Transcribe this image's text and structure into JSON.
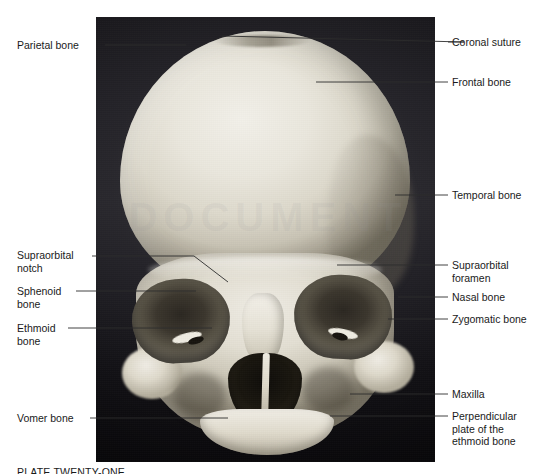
{
  "figure": {
    "watermark_text": "DOCUMENT",
    "caption": "PLATE TWENTY-ONE"
  },
  "photo": {
    "subject": "anterior view of human skull",
    "backdrop_color": "#1d1c21",
    "bone_color": "#eae7dd",
    "leader_line_color": "#2c2c2c"
  },
  "labels_left": [
    {
      "id": "parietal-bone",
      "text": "Parietal bone",
      "text_x": 17,
      "text_y": 39,
      "line_y": 45,
      "line_from_x": 105,
      "line_to_x": 186,
      "target_x": 186,
      "target_y": 45
    },
    {
      "id": "supraorbital-notch",
      "text": "Supraorbital\nnotch",
      "text_x": 17,
      "text_y": 249,
      "line_y": 256,
      "line_from_x": 92,
      "line_to_x": 228,
      "target_x": 228,
      "target_y": 282
    },
    {
      "id": "sphenoid-bone",
      "text": "Sphenoid\nbone",
      "text_x": 17,
      "text_y": 285,
      "line_y": 291,
      "line_from_x": 76,
      "line_to_x": 196,
      "target_x": 196,
      "target_y": 291
    },
    {
      "id": "ethmoid-bone",
      "text": "Ethmoid\nbone",
      "text_x": 17,
      "text_y": 322,
      "line_y": 328,
      "line_from_x": 68,
      "line_to_x": 212,
      "target_x": 212,
      "target_y": 328
    },
    {
      "id": "vomer-bone",
      "text": "Vomer bone",
      "text_x": 17,
      "text_y": 412,
      "line_y": 418,
      "line_from_x": 90,
      "line_to_x": 228,
      "target_x": 228,
      "target_y": 418
    }
  ],
  "labels_right": [
    {
      "id": "coronal-suture",
      "text": "Coronal suture",
      "text_x": 452,
      "text_y": 36,
      "line_y": 42,
      "line_from_x": 436,
      "line_to_x": 448,
      "target_x": 222,
      "target_y": 36
    },
    {
      "id": "frontal-bone",
      "text": "Frontal bone",
      "text_x": 452,
      "text_y": 76,
      "line_y": 82,
      "line_from_x": 436,
      "line_to_x": 448,
      "target_x": 316,
      "target_y": 82
    },
    {
      "id": "temporal-bone",
      "text": "Temporal bone",
      "text_x": 452,
      "text_y": 189,
      "line_y": 195,
      "line_from_x": 395,
      "line_to_x": 448,
      "target_x": 395,
      "target_y": 195
    },
    {
      "id": "supraorbital-foramen",
      "text": "Supraorbital\nforamen",
      "text_x": 452,
      "text_y": 259,
      "line_y": 265,
      "line_from_x": 337,
      "line_to_x": 448,
      "target_x": 337,
      "target_y": 265
    },
    {
      "id": "nasal-bone",
      "text": "Nasal bone",
      "text_x": 452,
      "text_y": 291,
      "line_y": 297,
      "line_from_x": 398,
      "line_to_x": 448,
      "target_x": 398,
      "target_y": 297
    },
    {
      "id": "zygomatic-bone",
      "text": "Zygomatic bone",
      "text_x": 452,
      "text_y": 313,
      "line_y": 319,
      "line_from_x": 388,
      "line_to_x": 448,
      "target_x": 388,
      "target_y": 319
    },
    {
      "id": "maxilla",
      "text": "Maxilla",
      "text_x": 452,
      "text_y": 388,
      "line_y": 394,
      "line_from_x": 350,
      "line_to_x": 448,
      "target_x": 350,
      "target_y": 394
    },
    {
      "id": "perpendicular-plate",
      "text": "Perpendicular\nplate of the\nethmoid bone",
      "text_x": 452,
      "text_y": 410,
      "line_y": 416,
      "line_from_x": 330,
      "line_to_x": 448,
      "target_x": 330,
      "target_y": 416
    }
  ]
}
